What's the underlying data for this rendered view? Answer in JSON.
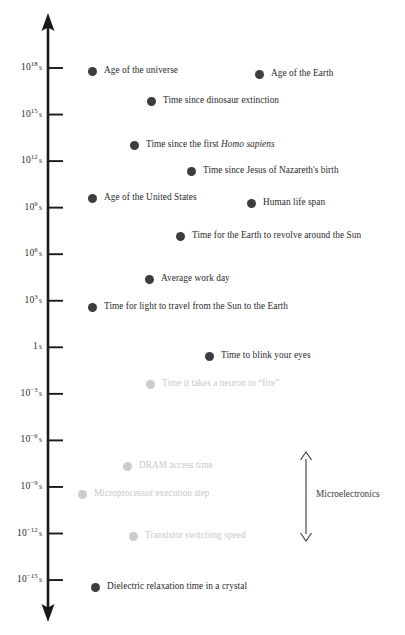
{
  "chart_data": {
    "type": "scatter",
    "title": "",
    "subtitle": "",
    "xlabel": "",
    "ylabel": "Time (seconds, logarithmic)",
    "orientation": "vertical-log-axis",
    "axis": {
      "scale": "log10",
      "unit": "s",
      "direction": "downward-decreasing",
      "top_arrow": true,
      "bottom_arrow": true,
      "ylim": [
        -15,
        18
      ],
      "grid": false,
      "legend": false
    },
    "ticks": [
      {
        "exponent": 18,
        "mantissa": "10",
        "sup": "18",
        "unit": "s",
        "label": "10^18 s"
      },
      {
        "exponent": 15,
        "mantissa": "10",
        "sup": "15",
        "unit": "s",
        "label": "10^15 s"
      },
      {
        "exponent": 12,
        "mantissa": "10",
        "sup": "12",
        "unit": "s",
        "label": "10^12 s"
      },
      {
        "exponent": 9,
        "mantissa": "10",
        "sup": "9",
        "unit": "s",
        "label": "10^9 s"
      },
      {
        "exponent": 6,
        "mantissa": "10",
        "sup": "6",
        "unit": "s",
        "label": "10^6 s"
      },
      {
        "exponent": 3,
        "mantissa": "10",
        "sup": "3",
        "unit": "s",
        "label": "10^3 s"
      },
      {
        "exponent": 0,
        "mantissa": "1",
        "sup": "",
        "unit": "s",
        "label": "1 s"
      },
      {
        "exponent": -3,
        "mantissa": "10",
        "sup": "−3",
        "unit": "s",
        "label": "10^-3 s"
      },
      {
        "exponent": -6,
        "mantissa": "10",
        "sup": "−6",
        "unit": "s",
        "label": "10^-6 s"
      },
      {
        "exponent": -9,
        "mantissa": "10",
        "sup": "−9",
        "unit": "s",
        "label": "10^-9 s"
      },
      {
        "exponent": -12,
        "mantissa": "10",
        "sup": "−12",
        "unit": "s",
        "label": "10^-12 s"
      },
      {
        "exponent": -15,
        "mantissa": "10",
        "sup": "−15",
        "unit": "s",
        "label": "10^-15 s"
      }
    ],
    "points": [
      {
        "label": "Age of the universe",
        "exponent": 17.6,
        "x": 88,
        "y": 71,
        "faded": false,
        "italic_part": ""
      },
      {
        "label": "Age of the Earth",
        "exponent": 17.4,
        "x": 255,
        "y": 74,
        "faded": false,
        "italic_part": ""
      },
      {
        "label": "Time since dinosaur extinction",
        "exponent": 15.6,
        "x": 147,
        "y": 101,
        "faded": false,
        "italic_part": ""
      },
      {
        "label": "Time since the first Homo sapiens",
        "exponent": 13.1,
        "x": 130,
        "y": 145,
        "faded": false,
        "italic_part": "Homo sapiens"
      },
      {
        "label": "Time since Jesus of Nazareth's birth",
        "exponent": 11.0,
        "x": 187,
        "y": 171,
        "faded": false,
        "italic_part": ""
      },
      {
        "label": "Age of the United States",
        "exponent": 9.9,
        "x": 88,
        "y": 198,
        "faded": false,
        "italic_part": ""
      },
      {
        "label": "Human life span",
        "exponent": 9.3,
        "x": 247,
        "y": 203,
        "faded": false,
        "italic_part": ""
      },
      {
        "label": "Time for the Earth to revolve around the Sun",
        "exponent": 7.5,
        "x": 176,
        "y": 236,
        "faded": false,
        "italic_part": ""
      },
      {
        "label": "Average work day",
        "exponent": 4.5,
        "x": 145,
        "y": 279,
        "faded": false,
        "italic_part": ""
      },
      {
        "label": "Time for light to travel from the Sun to the Earth",
        "exponent": 2.7,
        "x": 88,
        "y": 307,
        "faded": false,
        "italic_part": ""
      },
      {
        "label": "Time to blink your eyes",
        "exponent": -0.6,
        "x": 205,
        "y": 356,
        "faded": false,
        "italic_part": ""
      },
      {
        "label": "Time it takes a neuron to “fire”",
        "exponent": -2.2,
        "x": 146,
        "y": 384,
        "faded": true,
        "italic_part": ""
      },
      {
        "label": "DRAM access time",
        "exponent": -7.8,
        "x": 123,
        "y": 466,
        "faded": true,
        "italic_part": ""
      },
      {
        "label": "Microprocessor execution step",
        "exponent": -9.0,
        "x": 78,
        "y": 494,
        "faded": true,
        "italic_part": ""
      },
      {
        "label": "Transistor switching speed",
        "exponent": -11.5,
        "x": 129,
        "y": 536,
        "faded": true,
        "italic_part": ""
      },
      {
        "label": "Dielectric relaxation time in a crystal",
        "exponent": -15.0,
        "x": 91,
        "y": 587,
        "faded": false,
        "italic_part": ""
      }
    ],
    "annotations": [
      {
        "label": "Microelectronics",
        "type": "double-headed-arrow-bracket",
        "arrow_x": 306,
        "arrow_top_y": 452,
        "arrow_bottom_y": 541,
        "label_x": 316,
        "label_y": 495,
        "covers_exponent_range": [
          -12,
          -6
        ]
      }
    ],
    "colors": {
      "axis": "#1a1a1a",
      "dot": "#3d3d3d",
      "dot_faded": "#cccccc",
      "text": "#2b2b2b",
      "text_faded": "#c9c9c9",
      "annotation": "#3a3a3a",
      "background": "#ffffff"
    }
  }
}
